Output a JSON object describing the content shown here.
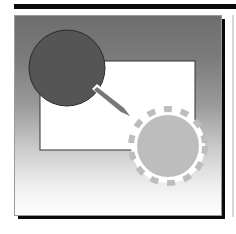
{
  "figure": {
    "icons": [
      {
        "name": "source-circle-icon",
        "color": "#555555"
      },
      {
        "name": "arrow-icon",
        "color": "#777777"
      },
      {
        "name": "target-dashed-circle-icon",
        "color": "#bdbdbd"
      }
    ],
    "colors": {
      "top_bar": "#0a0a0a",
      "gradient_top": "#6e6e6e",
      "gradient_bottom": "#ffffff",
      "shadow": "#0a0a0a",
      "rectangle_fill": "#ffffff",
      "rectangle_border": "#333333"
    }
  }
}
